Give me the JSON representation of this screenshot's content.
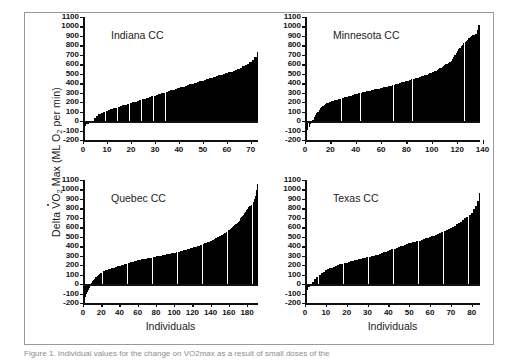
{
  "figure": {
    "y_axis_title_parts": {
      "delta": "Delta ",
      "v": "V",
      "o": "O",
      "o_sub": "2",
      "max": " Max (ML O",
      "max_sub": "2",
      "tail": " per min)"
    },
    "y_axis_title_plain": "Delta VO2 Max (ML O2 per min)",
    "caption": "Figure 1. Individual values for the change on VO2max as a result of small doses of the"
  },
  "chart_data": [
    {
      "type": "bar",
      "title": "Indiana CC",
      "panel": "top-left",
      "xlabel": "",
      "ylabel": "Delta VO2 Max (ML O2 per min)",
      "xlim": [
        0,
        73
      ],
      "ylim": [
        -200,
        1100
      ],
      "ytick_labels": [
        "1100",
        "1000",
        "900",
        "800",
        "700",
        "600",
        "500",
        "400",
        "300",
        "200",
        "100",
        "0",
        "-100",
        "-200"
      ],
      "ytick_values": [
        1100,
        1000,
        900,
        800,
        700,
        600,
        500,
        400,
        300,
        200,
        100,
        0,
        -100,
        -200
      ],
      "xtick_labels": [
        "0",
        "10",
        "20",
        "30",
        "40",
        "50",
        "60",
        "70"
      ],
      "xtick_values": [
        0,
        10,
        20,
        30,
        40,
        50,
        60,
        70
      ],
      "grid": false,
      "legend": "none",
      "n": 73,
      "categories": [
        1,
        2,
        3,
        4,
        5,
        6,
        7,
        8,
        9,
        10,
        11,
        12,
        13,
        14,
        15,
        16,
        17,
        18,
        19,
        20,
        21,
        22,
        23,
        24,
        25,
        26,
        27,
        28,
        29,
        30,
        31,
        32,
        33,
        34,
        35,
        36,
        37,
        38,
        39,
        40,
        41,
        42,
        43,
        44,
        45,
        46,
        47,
        48,
        49,
        50,
        51,
        52,
        53,
        54,
        55,
        56,
        57,
        58,
        59,
        60,
        61,
        62,
        63,
        64,
        65,
        66,
        67,
        68,
        69,
        70,
        71,
        72,
        73
      ],
      "values": [
        -55,
        -30,
        -12,
        5,
        30,
        55,
        72,
        86,
        98,
        108,
        118,
        126,
        134,
        142,
        150,
        158,
        166,
        174,
        182,
        190,
        198,
        206,
        214,
        222,
        230,
        238,
        246,
        254,
        262,
        270,
        278,
        286,
        294,
        300,
        308,
        316,
        324,
        332,
        340,
        348,
        356,
        364,
        372,
        380,
        388,
        396,
        404,
        412,
        420,
        428,
        436,
        444,
        452,
        460,
        468,
        476,
        484,
        492,
        500,
        508,
        516,
        524,
        532,
        542,
        554,
        566,
        578,
        592,
        608,
        626,
        648,
        676,
        725
      ]
    },
    {
      "type": "bar",
      "title": "Minnesota CC",
      "panel": "top-right",
      "xlabel": "",
      "ylabel": "Delta VO2 Max (ML O2 per min)",
      "xlim": [
        0,
        138
      ],
      "ylim": [
        -200,
        1100
      ],
      "ytick_labels": [
        "1100",
        "1000",
        "900",
        "800",
        "700",
        "600",
        "500",
        "400",
        "300",
        "200",
        "100",
        "0",
        "-100",
        "-200"
      ],
      "ytick_values": [
        1100,
        1000,
        900,
        800,
        700,
        600,
        500,
        400,
        300,
        200,
        100,
        0,
        -100,
        -200
      ],
      "xtick_labels": [
        "0",
        "20",
        "40",
        "60",
        "80",
        "100",
        "120",
        "140"
      ],
      "xtick_values": [
        0,
        20,
        40,
        60,
        80,
        100,
        120,
        140
      ],
      "grid": false,
      "legend": "none",
      "n": 138,
      "categories": [
        1,
        2,
        3,
        4,
        5,
        6,
        7,
        8,
        9,
        10,
        11,
        12,
        13,
        14,
        15,
        16,
        17,
        18,
        19,
        20,
        21,
        22,
        23,
        24,
        25,
        26,
        27,
        28,
        29,
        30,
        31,
        32,
        33,
        34,
        35,
        36,
        37,
        38,
        39,
        40,
        41,
        42,
        43,
        44,
        45,
        46,
        47,
        48,
        49,
        50,
        51,
        52,
        53,
        54,
        55,
        56,
        57,
        58,
        59,
        60,
        61,
        62,
        63,
        64,
        65,
        66,
        67,
        68,
        69,
        70,
        71,
        72,
        73,
        74,
        75,
        76,
        77,
        78,
        79,
        80,
        81,
        82,
        83,
        84,
        85,
        86,
        87,
        88,
        89,
        90,
        91,
        92,
        93,
        94,
        95,
        96,
        97,
        98,
        99,
        100,
        101,
        102,
        103,
        104,
        105,
        106,
        107,
        108,
        109,
        110,
        111,
        112,
        113,
        114,
        115,
        116,
        117,
        118,
        119,
        120,
        121,
        122,
        123,
        124,
        125,
        126,
        127,
        128,
        129,
        130,
        131,
        132,
        133,
        134,
        135,
        136,
        137,
        138
      ],
      "values": [
        -120,
        -90,
        -60,
        -35,
        -10,
        15,
        40,
        62,
        82,
        100,
        118,
        134,
        148,
        160,
        170,
        180,
        188,
        195,
        200,
        205,
        210,
        214,
        218,
        222,
        226,
        230,
        234,
        238,
        242,
        246,
        250,
        254,
        258,
        262,
        266,
        270,
        274,
        278,
        282,
        286,
        290,
        294,
        298,
        302,
        306,
        310,
        312,
        315,
        318,
        320,
        323,
        326,
        329,
        332,
        335,
        338,
        341,
        344,
        347,
        350,
        353,
        356,
        359,
        362,
        365,
        368,
        372,
        376,
        380,
        384,
        388,
        392,
        396,
        400,
        404,
        408,
        412,
        416,
        420,
        424,
        428,
        432,
        436,
        440,
        444,
        448,
        452,
        456,
        460,
        464,
        468,
        472,
        477,
        482,
        487,
        492,
        498,
        504,
        510,
        516,
        522,
        528,
        534,
        540,
        548,
        556,
        564,
        572,
        580,
        590,
        600,
        608,
        612,
        620,
        635,
        655,
        680,
        700,
        720,
        740,
        760,
        775,
        790,
        805,
        820,
        835,
        850,
        862,
        875,
        888,
        898,
        905,
        912,
        918,
        925,
        960,
        1020,
        1095
      ]
    },
    {
      "type": "bar",
      "title": "Quebec CC",
      "panel": "bottom-left",
      "xlabel": "Individuals",
      "ylabel": "Delta VO2 Max (ML O2 per min)",
      "xlim": [
        0,
        192
      ],
      "ylim": [
        -200,
        1100
      ],
      "ytick_labels": [
        "1100",
        "1000",
        "900",
        "800",
        "700",
        "600",
        "500",
        "400",
        "300",
        "200",
        "100",
        "0",
        "-100",
        "-200"
      ],
      "ytick_values": [
        1100,
        1000,
        900,
        800,
        700,
        600,
        500,
        400,
        300,
        200,
        100,
        0,
        -100,
        -200
      ],
      "xtick_labels": [
        "0",
        "20",
        "40",
        "60",
        "80",
        "100",
        "120",
        "140",
        "160",
        "180"
      ],
      "xtick_values": [
        0,
        20,
        40,
        60,
        80,
        100,
        120,
        140,
        160,
        180
      ],
      "grid": false,
      "legend": "none",
      "n": 192,
      "categories": [
        1,
        2,
        3,
        4,
        5,
        6,
        7,
        8,
        9,
        10,
        11,
        12,
        13,
        14,
        15,
        16,
        17,
        18,
        19,
        20,
        21,
        22,
        23,
        24,
        25,
        26,
        27,
        28,
        29,
        30,
        31,
        32,
        33,
        34,
        35,
        36,
        37,
        38,
        39,
        40,
        41,
        42,
        43,
        44,
        45,
        46,
        47,
        48,
        49,
        50,
        51,
        52,
        53,
        54,
        55,
        56,
        57,
        58,
        59,
        60,
        61,
        62,
        63,
        64,
        65,
        66,
        67,
        68,
        69,
        70,
        71,
        72,
        73,
        74,
        75,
        76,
        77,
        78,
        79,
        80,
        81,
        82,
        83,
        84,
        85,
        86,
        87,
        88,
        89,
        90,
        91,
        92,
        93,
        94,
        95,
        96,
        97,
        98,
        99,
        100,
        101,
        102,
        103,
        104,
        105,
        106,
        107,
        108,
        109,
        110,
        111,
        112,
        113,
        114,
        115,
        116,
        117,
        118,
        119,
        120,
        121,
        122,
        123,
        124,
        125,
        126,
        127,
        128,
        129,
        130,
        131,
        132,
        133,
        134,
        135,
        136,
        137,
        138,
        139,
        140,
        141,
        142,
        143,
        144,
        145,
        146,
        147,
        148,
        149,
        150,
        151,
        152,
        153,
        154,
        155,
        156,
        157,
        158,
        159,
        160,
        161,
        162,
        163,
        164,
        165,
        166,
        167,
        168,
        169,
        170,
        171,
        172,
        173,
        174,
        175,
        176,
        177,
        178,
        179,
        180,
        181,
        182,
        183,
        184,
        185,
        186,
        187,
        188,
        189,
        190,
        191,
        192
      ],
      "values": [
        -175,
        -140,
        -110,
        -85,
        -60,
        -40,
        -20,
        0,
        15,
        30,
        45,
        58,
        70,
        80,
        90,
        98,
        105,
        112,
        118,
        124,
        130,
        135,
        140,
        144,
        148,
        152,
        156,
        160,
        163,
        166,
        169,
        172,
        175,
        178,
        181,
        184,
        187,
        190,
        193,
        196,
        199,
        202,
        205,
        208,
        211,
        214,
        217,
        220,
        223,
        226,
        229,
        232,
        235,
        238,
        241,
        244,
        247,
        250,
        252,
        254,
        256,
        258,
        260,
        262,
        264,
        266,
        268,
        270,
        272,
        274,
        276,
        278,
        280,
        282,
        284,
        286,
        288,
        290,
        292,
        294,
        296,
        298,
        300,
        302,
        304,
        306,
        308,
        310,
        312,
        314,
        316,
        318,
        320,
        322,
        324,
        326,
        328,
        330,
        332,
        334,
        336,
        338,
        340,
        343,
        346,
        349,
        352,
        355,
        358,
        361,
        364,
        367,
        370,
        373,
        376,
        379,
        382,
        385,
        388,
        391,
        394,
        397,
        400,
        403,
        406,
        410,
        414,
        418,
        422,
        426,
        430,
        434,
        438,
        442,
        446,
        450,
        455,
        460,
        465,
        470,
        475,
        480,
        485,
        490,
        495,
        500,
        506,
        512,
        518,
        524,
        530,
        536,
        542,
        548,
        554,
        560,
        568,
        576,
        584,
        592,
        600,
        610,
        620,
        630,
        640,
        650,
        660,
        672,
        684,
        696,
        708,
        720,
        735,
        750,
        765,
        780,
        795,
        810,
        820,
        828,
        836,
        845,
        855,
        870,
        895,
        935,
        990,
        1060,
        1098
      ]
    },
    {
      "type": "bar",
      "title": "Texas CC",
      "panel": "bottom-right",
      "xlabel": "Individuals",
      "ylabel": "Delta VO2 Max (ML O2 per min)",
      "xlim": [
        0,
        84
      ],
      "ylim": [
        -200,
        1100
      ],
      "ytick_labels": [
        "1100",
        "1000",
        "900",
        "800",
        "700",
        "600",
        "500",
        "400",
        "300",
        "200",
        "100",
        "0",
        "-100",
        "-200"
      ],
      "ytick_values": [
        1100,
        1000,
        900,
        800,
        700,
        600,
        500,
        400,
        300,
        200,
        100,
        0,
        -100,
        -200
      ],
      "xtick_labels": [
        "0",
        "10",
        "20",
        "30",
        "40",
        "50",
        "60",
        "70",
        "80"
      ],
      "xtick_values": [
        0,
        10,
        20,
        30,
        40,
        50,
        60,
        70,
        80
      ],
      "grid": false,
      "legend": "none",
      "n": 84,
      "categories": [
        1,
        2,
        3,
        4,
        5,
        6,
        7,
        8,
        9,
        10,
        11,
        12,
        13,
        14,
        15,
        16,
        17,
        18,
        19,
        20,
        21,
        22,
        23,
        24,
        25,
        26,
        27,
        28,
        29,
        30,
        31,
        32,
        33,
        34,
        35,
        36,
        37,
        38,
        39,
        40,
        41,
        42,
        43,
        44,
        45,
        46,
        47,
        48,
        49,
        50,
        51,
        52,
        53,
        54,
        55,
        56,
        57,
        58,
        59,
        60,
        61,
        62,
        63,
        64,
        65,
        66,
        67,
        68,
        69,
        70,
        71,
        72,
        73,
        74,
        75,
        76,
        77,
        78,
        79,
        80,
        81,
        82,
        83,
        84
      ],
      "values": [
        -60,
        -35,
        -10,
        20,
        50,
        78,
        100,
        118,
        132,
        145,
        155,
        165,
        175,
        185,
        193,
        200,
        208,
        215,
        222,
        228,
        234,
        240,
        246,
        252,
        258,
        263,
        268,
        273,
        278,
        283,
        288,
        293,
        298,
        303,
        310,
        318,
        326,
        334,
        342,
        350,
        358,
        366,
        374,
        382,
        390,
        398,
        406,
        414,
        422,
        430,
        436,
        442,
        448,
        452,
        458,
        466,
        474,
        482,
        490,
        498,
        506,
        512,
        520,
        530,
        540,
        550,
        560,
        570,
        580,
        592,
        604,
        616,
        630,
        645,
        660,
        678,
        696,
        712,
        730,
        750,
        790,
        830,
        880,
        960
      ]
    }
  ]
}
